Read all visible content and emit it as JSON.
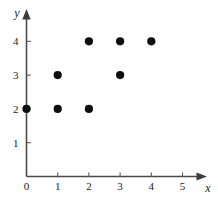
{
  "chart_data": {
    "type": "scatter",
    "title": "",
    "subtitle": "",
    "xlabel": "x",
    "ylabel": "y",
    "xlim": [
      0,
      5.6
    ],
    "ylim": [
      0,
      4.9
    ],
    "xticks": [
      0,
      1,
      2,
      3,
      4,
      5
    ],
    "yticks": [
      1,
      2,
      3,
      4
    ],
    "xtick_labels": [
      "0",
      "1",
      "2",
      "3",
      "4",
      "5"
    ],
    "ytick_labels": [
      "1",
      "2",
      "3",
      "4"
    ],
    "grid": false,
    "legend": null,
    "marker": "filled-circle",
    "marker_color": "#0d0d0d",
    "axis_color": "#4a4a4a",
    "points": [
      {
        "x": 0,
        "y": 2
      },
      {
        "x": 1,
        "y": 2
      },
      {
        "x": 1,
        "y": 3
      },
      {
        "x": 2,
        "y": 2
      },
      {
        "x": 2,
        "y": 4
      },
      {
        "x": 3,
        "y": 3
      },
      {
        "x": 3,
        "y": 4
      },
      {
        "x": 4,
        "y": 4
      }
    ]
  }
}
